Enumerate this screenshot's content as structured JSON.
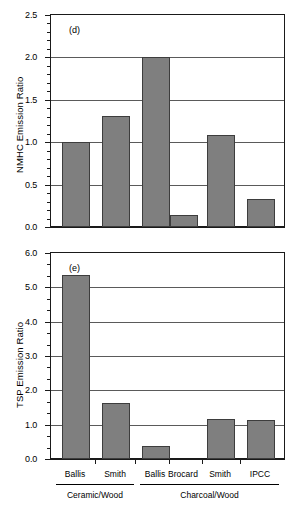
{
  "chart_data": [
    {
      "type": "bar",
      "panel_tag": "(d)",
      "title": "",
      "xlabel": "",
      "ylabel": "NMHC Emission Ratio",
      "ylim": [
        0.0,
        2.5
      ],
      "yticks": [
        "0.0",
        "0.5",
        "1.0",
        "1.5",
        "2.0",
        "2.5"
      ],
      "ytick_values": [
        0.0,
        0.5,
        1.0,
        1.5,
        2.0,
        2.5
      ],
      "minor_ticks_per_interval": 4,
      "grid": "horizontal",
      "legend": "none",
      "categories": [
        "Ballis",
        "Smith",
        "Ballis",
        "Brocard",
        "Smith",
        "IPCC"
      ],
      "values": [
        1.0,
        1.31,
        2.0,
        0.14,
        1.09,
        0.33
      ]
    },
    {
      "type": "bar",
      "panel_tag": "(e)",
      "title": "",
      "xlabel": "",
      "ylabel": "TSP Emission Ratio",
      "ylim": [
        0.0,
        6.0
      ],
      "yticks": [
        "0.0",
        "1.0",
        "2.0",
        "3.0",
        "4.0",
        "5.0",
        "6.0"
      ],
      "ytick_values": [
        0.0,
        1.0,
        2.0,
        3.0,
        4.0,
        5.0,
        6.0
      ],
      "minor_ticks_per_interval": 2,
      "grid": "horizontal",
      "legend": "none",
      "categories": [
        "Ballis",
        "Smith",
        "Ballis",
        "Brocard",
        "Smith",
        "IPCC"
      ],
      "values": [
        5.35,
        1.63,
        0.38,
        0.0,
        1.16,
        1.14
      ]
    }
  ],
  "axis_groups": [
    {
      "label": "Ceramic/Wood",
      "members": [
        "Ballis",
        "Smith"
      ]
    },
    {
      "label": "Charcoal/Wood",
      "members": [
        "Ballis",
        "Brocard",
        "Smith",
        "IPCC"
      ]
    }
  ],
  "style": {
    "bar_fill": "#7f7f7f",
    "bar_stroke": "#3d3d3d",
    "axis_color": "#1a1a1a",
    "grid_color": "#5a5a5a",
    "background": "#ffffff"
  }
}
